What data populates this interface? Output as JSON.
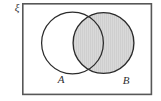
{
  "figure": {
    "type": "venn-diagram",
    "title_symbol": "ξ",
    "universe_label": "ξ",
    "background_color": "#ffffff",
    "rectangle": {
      "name": "universal-set",
      "x": 22,
      "y": 3,
      "width": 130,
      "height": 92,
      "stroke_color": "#585858",
      "fill_color": "#ffffff",
      "stroke_width": 1.6
    },
    "sets": [
      {
        "id": "A",
        "label": "A",
        "cx": 72.5,
        "cy": 43,
        "r": 31.5,
        "fill_color": "#ffffff",
        "shaded": false,
        "stroke_color": "#2b2b2b",
        "label_x": 61,
        "label_y": 80
      },
      {
        "id": "B",
        "label": "B",
        "cx": 103.5,
        "cy": 43,
        "r": 31,
        "fill_color": "#d6d6d6",
        "shaded": true,
        "stroke_color": "#2b2b2b",
        "label_x": 126,
        "label_y": 81
      }
    ],
    "shading": {
      "region_description": "B",
      "color": "#d6d6d6",
      "pattern": "fine-vertical-lines",
      "pattern_line_color": "#c9c9c9"
    },
    "colors": {
      "outline": "#2b2b2b",
      "rectangle_border": "#585858",
      "shade": "#d6d6d6",
      "text": "#2f2f2f"
    }
  }
}
